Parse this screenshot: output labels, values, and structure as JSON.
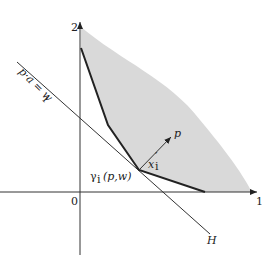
{
  "figure": {
    "y_axis_tick": "2",
    "x_axis_tick": "1",
    "origin_label": "0",
    "budget_line_label": "p·a = w_i",
    "budget_line_text": "p·a = w",
    "budget_line_sub": "i",
    "hyperplane_label": "H",
    "vector_label": "p",
    "point_label_main": "x",
    "point_label_sub": "i",
    "point_label_sup": "′",
    "demand_label": "γ",
    "demand_label_sub": "i",
    "demand_label_args": "(p,w)",
    "colors": {
      "shade": "#d9d9d9",
      "line": "#222222"
    }
  }
}
